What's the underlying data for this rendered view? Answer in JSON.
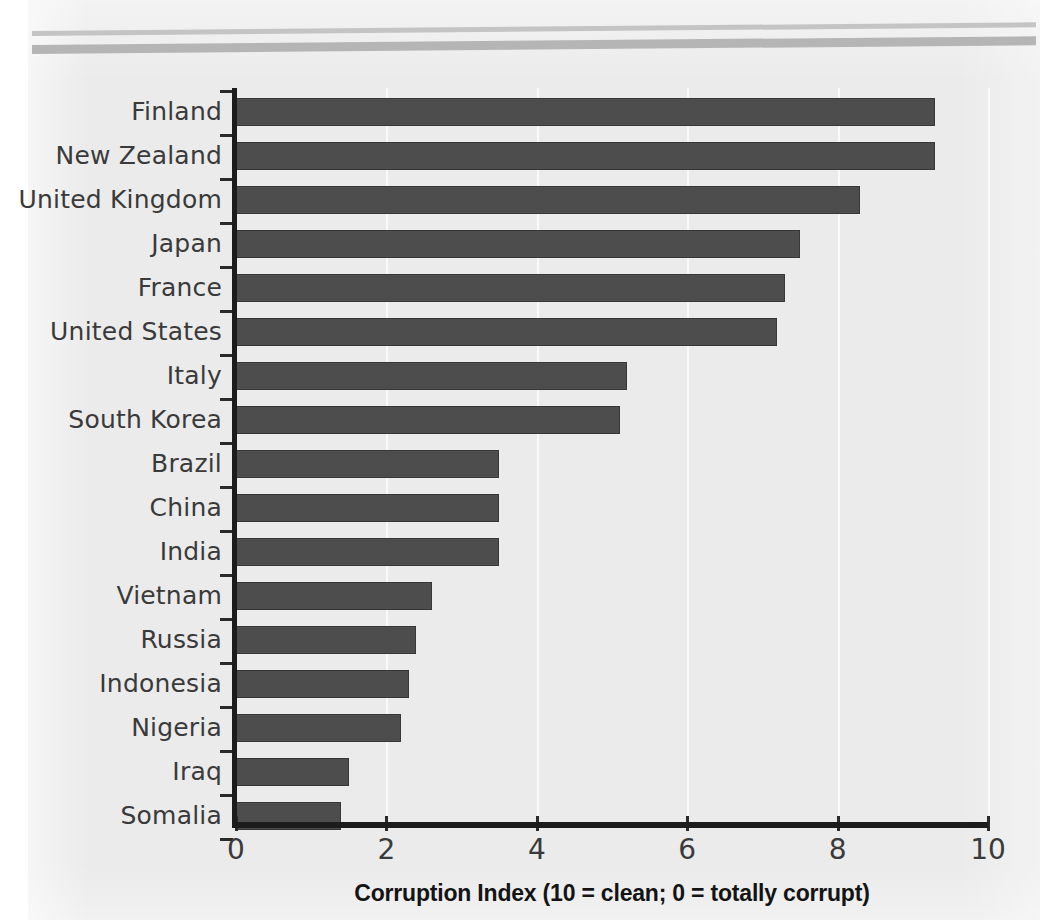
{
  "chart_data": {
    "type": "bar",
    "orientation": "horizontal",
    "title": "",
    "xlabel": "Corruption Index (10 = clean; 0 = totally corrupt)",
    "ylabel": "",
    "xlim": [
      0,
      10
    ],
    "xticks": [
      "0",
      "2",
      "4",
      "6",
      "8",
      "10"
    ],
    "grid": "vertical-faint",
    "legend": "none",
    "categories": [
      "Finland",
      "New Zealand",
      "United Kingdom",
      "Japan",
      "France",
      "United States",
      "Italy",
      "South Korea",
      "Brazil",
      "China",
      "India",
      "Vietnam",
      "Russia",
      "Indonesia",
      "Nigeria",
      "Iraq",
      "Somalia"
    ],
    "values": [
      9.3,
      9.3,
      8.3,
      7.5,
      7.3,
      7.2,
      5.2,
      5.1,
      3.5,
      3.5,
      3.5,
      2.6,
      2.4,
      2.3,
      2.2,
      1.5,
      1.4
    ],
    "bar_color": "#4d4d4d",
    "background_color": "#ebebeb",
    "axis_color": "#1c1c1c",
    "text_color": "#3a3a3a"
  }
}
